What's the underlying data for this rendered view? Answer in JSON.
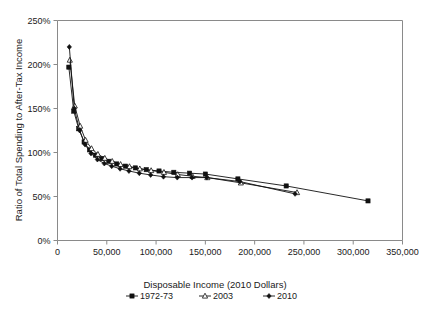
{
  "chart_data": {
    "type": "line",
    "title": "",
    "xlabel": "Disposable Income (2010 Dollars)",
    "ylabel": "Ratio of Total Spending to After-Tax Income",
    "xlim": [
      0,
      350000
    ],
    "ylim": [
      0,
      2.5
    ],
    "grid": false,
    "legend_position": "bottom",
    "x_tick_labels": [
      "0",
      "50,000",
      "100,000",
      "150,000",
      "200,000",
      "250,000",
      "300,000",
      "350,000"
    ],
    "x_ticks": [
      0,
      50000,
      100000,
      150000,
      200000,
      250000,
      300000,
      350000
    ],
    "y_tick_labels": [
      "0%",
      "50%",
      "100%",
      "150%",
      "200%",
      "250%"
    ],
    "y_ticks": [
      0,
      0.5,
      1.0,
      1.5,
      2.0,
      2.5
    ],
    "series": [
      {
        "name": "1972-73",
        "marker": "filled-square",
        "points": [
          [
            11500,
            1.97
          ],
          [
            16500,
            1.47
          ],
          [
            21500,
            1.27
          ],
          [
            27000,
            1.12
          ],
          [
            32500,
            1.03
          ],
          [
            38500,
            0.97
          ],
          [
            45000,
            0.93
          ],
          [
            52000,
            0.9
          ],
          [
            60000,
            0.87
          ],
          [
            69000,
            0.845
          ],
          [
            79000,
            0.825
          ],
          [
            90000,
            0.805
          ],
          [
            103000,
            0.79
          ],
          [
            118000,
            0.775
          ],
          [
            134000,
            0.765
          ],
          [
            150000,
            0.755
          ],
          [
            183000,
            0.7
          ],
          [
            232000,
            0.62
          ],
          [
            315000,
            0.45
          ]
        ]
      },
      {
        "name": "2003",
        "marker": "open-triangle",
        "points": [
          [
            12500,
            2.05
          ],
          [
            17500,
            1.53
          ],
          [
            23000,
            1.3
          ],
          [
            28500,
            1.14
          ],
          [
            34500,
            1.045
          ],
          [
            41000,
            0.98
          ],
          [
            48000,
            0.935
          ],
          [
            55500,
            0.9
          ],
          [
            64000,
            0.865
          ],
          [
            73000,
            0.84
          ],
          [
            83500,
            0.815
          ],
          [
            95000,
            0.795
          ],
          [
            108000,
            0.775
          ],
          [
            122000,
            0.75
          ],
          [
            137000,
            0.73
          ],
          [
            152000,
            0.715
          ],
          [
            186000,
            0.655
          ],
          [
            243000,
            0.545
          ]
        ]
      },
      {
        "name": "2010",
        "marker": "filled-diamond",
        "points": [
          [
            12000,
            2.2
          ],
          [
            17000,
            1.5
          ],
          [
            22500,
            1.25
          ],
          [
            28000,
            1.09
          ],
          [
            34000,
            0.99
          ],
          [
            40500,
            0.92
          ],
          [
            47500,
            0.875
          ],
          [
            55000,
            0.845
          ],
          [
            63500,
            0.815
          ],
          [
            72500,
            0.79
          ],
          [
            83000,
            0.765
          ],
          [
            94500,
            0.745
          ],
          [
            107500,
            0.725
          ],
          [
            121500,
            0.715
          ],
          [
            136500,
            0.715
          ],
          [
            151500,
            0.715
          ],
          [
            185000,
            0.67
          ],
          [
            241000,
            0.53
          ]
        ]
      }
    ]
  },
  "legend": {
    "items": [
      {
        "label": "1972-73",
        "marker": "filled-square"
      },
      {
        "label": "2003",
        "marker": "open-triangle"
      },
      {
        "label": "2010",
        "marker": "filled-diamond"
      }
    ]
  },
  "colors": {
    "series": "#111111",
    "axis": "#8a8a8a",
    "background": "#ffffff"
  }
}
